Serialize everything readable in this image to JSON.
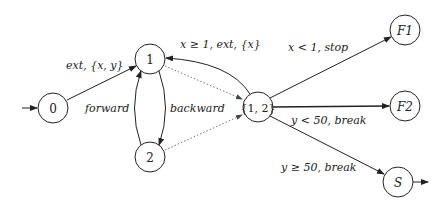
{
  "diagram": {
    "type": "automaton",
    "nodes": [
      {
        "id": "0",
        "label": "0",
        "x": 53,
        "y": 108
      },
      {
        "id": "1",
        "label": "1",
        "x": 150,
        "y": 59
      },
      {
        "id": "2",
        "label": "2",
        "x": 150,
        "y": 157
      },
      {
        "id": "12",
        "label": "{1, 2}",
        "x": 258,
        "y": 107
      },
      {
        "id": "F1",
        "label": "F1",
        "x": 405,
        "y": 30
      },
      {
        "id": "F2",
        "label": "F2",
        "x": 405,
        "y": 106
      },
      {
        "id": "S",
        "label": "S",
        "x": 398,
        "y": 182
      }
    ],
    "edges": [
      {
        "from": "start",
        "to": "0",
        "label": ""
      },
      {
        "from": "0",
        "to": "1",
        "label": "ext, {x, y}"
      },
      {
        "from": "2",
        "to": "1",
        "label": "forward"
      },
      {
        "from": "1",
        "to": "2",
        "label": "backward"
      },
      {
        "from": "12",
        "to": "1",
        "label": "x ≥ 1, ext, {x}"
      },
      {
        "from": "1",
        "to": "12",
        "label": "",
        "style": "dotted"
      },
      {
        "from": "2",
        "to": "12",
        "label": "",
        "style": "dotted"
      },
      {
        "from": "12",
        "to": "F1",
        "label": "x < 1, stop"
      },
      {
        "from": "12",
        "to": "F2",
        "label": "y < 50, break"
      },
      {
        "from": "12",
        "to": "S",
        "label": "y ≥ 50, break"
      },
      {
        "from": "S",
        "to": "exit",
        "label": ""
      }
    ]
  }
}
